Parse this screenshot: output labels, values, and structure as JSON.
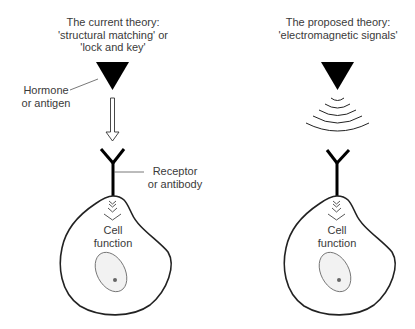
{
  "left_panel": {
    "title_lines": [
      "The current theory:",
      "'structural matching' or",
      "'lock and key'"
    ],
    "hormone_label_lines": [
      "Hormone",
      "or antigen"
    ],
    "receptor_label_lines": [
      "Receptor",
      "or antibody"
    ],
    "cell_label_lines": [
      "Cell",
      "function"
    ]
  },
  "right_panel": {
    "title_lines": [
      "The proposed theory:",
      "'electromagnetic signals'"
    ],
    "cell_label_lines": [
      "Cell",
      "function"
    ]
  },
  "colors": {
    "ink": "#000000",
    "text": "#3a3a3a",
    "cell_outline": "#222222",
    "nucleus_fill": "#f2f2f2"
  }
}
